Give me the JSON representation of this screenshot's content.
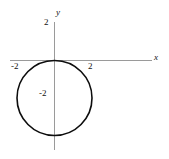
{
  "figure": {
    "background_color": "#ffffff",
    "width": 169,
    "height": 159
  },
  "axes": {
    "x_axis_label": "x",
    "y_axis_label": "y",
    "axis_color": "#9a9a9a",
    "x_ticks": [
      {
        "label": "-2",
        "value": -2
      },
      {
        "label": "2",
        "value": 2
      }
    ],
    "y_ticks": [
      {
        "label": "2",
        "value": 2
      },
      {
        "label": "-2",
        "value": -2
      }
    ]
  },
  "chart_data": {
    "type": "line",
    "title": "",
    "subtitle": "",
    "xlabel": "x",
    "ylabel": "y",
    "xlim": [
      -3.2,
      4.8
    ],
    "ylim": [
      -4.7,
      2.8
    ],
    "grid": false,
    "legend": null,
    "curve_color": "#0d0d0d",
    "series": [
      {
        "name": "circle",
        "shape": "circle",
        "equation": "x^2 + (y + 2)^2 = 4",
        "center_x": 0,
        "center_y": -2,
        "radius": 2,
        "x": [
          0,
          1,
          1.732,
          2,
          1.732,
          1,
          0,
          -1,
          -1.732,
          -2,
          -1.732,
          -1,
          0
        ],
        "y": [
          0,
          -0.268,
          -1,
          -2,
          -3,
          -3.732,
          -4,
          -3.732,
          -3,
          -2,
          -1,
          -0.268,
          0
        ]
      }
    ],
    "annotations": [
      {
        "text": "2",
        "x": 2,
        "y": 0,
        "role": "x-tick-label"
      },
      {
        "text": "-2",
        "x": -2,
        "y": 0,
        "role": "x-tick-label"
      },
      {
        "text": "2",
        "x": 0,
        "y": 2,
        "role": "y-tick-label"
      },
      {
        "text": "-2",
        "x": 0,
        "y": -2,
        "role": "y-tick-label"
      },
      {
        "text": "x",
        "x": 4.5,
        "y": 0,
        "role": "axis-name"
      },
      {
        "text": "y",
        "x": 0,
        "y": 2.6,
        "role": "axis-name"
      }
    ]
  }
}
